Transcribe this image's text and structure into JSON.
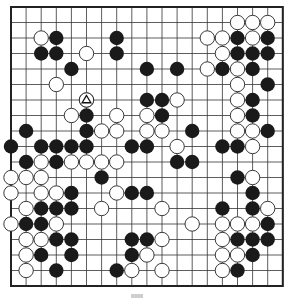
{
  "board": {
    "size": 19,
    "origin_x": 11,
    "origin_y": 7,
    "step_x": 15.1,
    "step_y": 15.5,
    "stone_radius": 7.2,
    "colors": {
      "line": "#333333",
      "border": "#222222",
      "black_stone": "#1a1a1a",
      "white_stone": "#ffffff",
      "white_stroke": "#222222"
    },
    "marked_stone": {
      "row": 6,
      "col": 5,
      "color": "white",
      "marker": "triangle"
    },
    "black": [
      [
        2,
        3
      ],
      [
        2,
        7
      ],
      [
        2,
        15
      ],
      [
        2,
        17
      ],
      [
        3,
        2
      ],
      [
        3,
        3
      ],
      [
        3,
        7
      ],
      [
        3,
        15
      ],
      [
        3,
        16
      ],
      [
        3,
        17
      ],
      [
        4,
        4
      ],
      [
        4,
        9
      ],
      [
        4,
        11
      ],
      [
        4,
        14
      ],
      [
        4,
        16
      ],
      [
        5,
        17
      ],
      [
        6,
        9
      ],
      [
        6,
        10
      ],
      [
        6,
        16
      ],
      [
        7,
        5
      ],
      [
        7,
        10
      ],
      [
        7,
        16
      ],
      [
        8,
        1
      ],
      [
        8,
        5
      ],
      [
        8,
        12
      ],
      [
        8,
        17
      ],
      [
        9,
        0
      ],
      [
        9,
        2
      ],
      [
        9,
        3
      ],
      [
        9,
        4
      ],
      [
        9,
        5
      ],
      [
        9,
        8
      ],
      [
        9,
        9
      ],
      [
        9,
        14
      ],
      [
        9,
        15
      ],
      [
        10,
        1
      ],
      [
        10,
        3
      ],
      [
        10,
        11
      ],
      [
        10,
        12
      ],
      [
        11,
        6
      ],
      [
        11,
        15
      ],
      [
        12,
        4
      ],
      [
        12,
        8
      ],
      [
        12,
        9
      ],
      [
        12,
        16
      ],
      [
        13,
        2
      ],
      [
        13,
        3
      ],
      [
        13,
        4
      ],
      [
        13,
        14
      ],
      [
        13,
        16
      ],
      [
        14,
        1
      ],
      [
        14,
        2
      ],
      [
        14,
        17
      ],
      [
        15,
        3
      ],
      [
        15,
        4
      ],
      [
        15,
        8
      ],
      [
        15,
        9
      ],
      [
        15,
        15
      ],
      [
        15,
        16
      ],
      [
        15,
        17
      ],
      [
        16,
        2
      ],
      [
        16,
        4
      ],
      [
        16,
        8
      ],
      [
        16,
        16
      ],
      [
        17,
        3
      ],
      [
        17,
        7
      ],
      [
        17,
        15
      ]
    ],
    "white": [
      [
        1,
        15
      ],
      [
        1,
        16
      ],
      [
        1,
        17
      ],
      [
        2,
        2
      ],
      [
        2,
        13
      ],
      [
        2,
        14
      ],
      [
        2,
        16
      ],
      [
        3,
        5
      ],
      [
        3,
        14
      ],
      [
        4,
        13
      ],
      [
        4,
        15
      ],
      [
        5,
        3
      ],
      [
        5,
        15
      ],
      [
        6,
        5
      ],
      [
        6,
        11
      ],
      [
        6,
        15
      ],
      [
        7,
        4
      ],
      [
        7,
        7
      ],
      [
        7,
        9
      ],
      [
        7,
        15
      ],
      [
        8,
        6
      ],
      [
        8,
        7
      ],
      [
        8,
        9
      ],
      [
        8,
        10
      ],
      [
        8,
        15
      ],
      [
        8,
        16
      ],
      [
        9,
        11
      ],
      [
        9,
        16
      ],
      [
        10,
        2
      ],
      [
        10,
        4
      ],
      [
        10,
        5
      ],
      [
        10,
        6
      ],
      [
        10,
        7
      ],
      [
        11,
        0
      ],
      [
        11,
        1
      ],
      [
        11,
        2
      ],
      [
        11,
        16
      ],
      [
        12,
        0
      ],
      [
        12,
        2
      ],
      [
        12,
        3
      ],
      [
        12,
        7
      ],
      [
        13,
        1
      ],
      [
        13,
        6
      ],
      [
        13,
        10
      ],
      [
        13,
        17
      ],
      [
        14,
        0
      ],
      [
        14,
        3
      ],
      [
        14,
        12
      ],
      [
        14,
        14
      ],
      [
        14,
        15
      ],
      [
        14,
        16
      ],
      [
        15,
        1
      ],
      [
        15,
        2
      ],
      [
        15,
        10
      ],
      [
        15,
        14
      ],
      [
        16,
        1
      ],
      [
        16,
        9
      ],
      [
        16,
        14
      ],
      [
        16,
        15
      ],
      [
        17,
        1
      ],
      [
        17,
        8
      ],
      [
        17,
        10
      ],
      [
        17,
        14
      ]
    ]
  }
}
